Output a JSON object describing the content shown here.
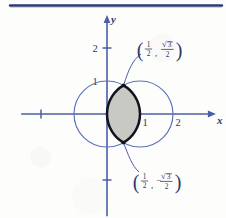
{
  "figure": {
    "title_rule": "top-horizontal-rule",
    "colors": {
      "axis": "#4a5fa5",
      "circle": "#5a72b8",
      "lens_outline": "#13131f",
      "lens_fill": "#c9c9c4",
      "label_text": "#2d3a6b",
      "rule": "#2b3a78",
      "background": "#fdfdfc"
    },
    "axes": {
      "x_axis_label": "x",
      "y_axis_label": "y",
      "origin_px": {
        "x": 107,
        "y": 114
      },
      "unit_px": 33,
      "x_ticks": [
        {
          "value": -2,
          "label": ""
        },
        {
          "value": 1,
          "label": "1"
        },
        {
          "value": 2,
          "label": "2"
        }
      ],
      "y_ticks": [
        {
          "value": 2,
          "label": "2"
        },
        {
          "value": 1,
          "label": "1"
        },
        {
          "value": -2,
          "label": ""
        }
      ],
      "x_range": [
        -2.6,
        3.3
      ],
      "y_range": [
        -3.1,
        3.0
      ]
    },
    "curves": [
      {
        "name": "circle-centered-origin",
        "cx": 0,
        "cy": 0,
        "r": 1
      },
      {
        "name": "circle-centered-one",
        "cx": 1,
        "cy": 0,
        "r": 1
      }
    ],
    "shaded_region": {
      "name": "lens-intersection",
      "description": "intersection of the two unit circles",
      "fill": "#c9c9c4"
    },
    "annotations": [
      {
        "name": "upper-intersection-point",
        "point": {
          "x": 0.5,
          "y": 0.8660254
        },
        "open_paren": "(",
        "x_num": "1",
        "x_den": "2",
        "comma": ",",
        "sign": "",
        "radical": "√",
        "y_num": "3",
        "y_den": "2",
        "close_paren": ")"
      },
      {
        "name": "lower-intersection-point",
        "point": {
          "x": 0.5,
          "y": -0.8660254
        },
        "open_paren": "(",
        "x_num": "1",
        "x_den": "2",
        "comma": ",",
        "sign": "−",
        "radical": "√",
        "y_num": "3",
        "y_den": "2",
        "close_paren": ")"
      }
    ]
  },
  "chart_data": {
    "type": "scatter",
    "title": "",
    "xlabel": "x",
    "ylabel": "y",
    "xlim": [
      -2.6,
      3.3
    ],
    "ylim": [
      -3.1,
      3.0
    ],
    "grid": false,
    "legend": "none",
    "xticks": [
      -2,
      1,
      2
    ],
    "xticklabels": [
      "",
      "1",
      "2"
    ],
    "yticks": [
      -2,
      1,
      2
    ],
    "yticklabels": [
      "",
      "1",
      "2"
    ],
    "series": [
      {
        "name": "circle x² + y² = 1",
        "type": "circle",
        "center": [
          0,
          0
        ],
        "radius": 1,
        "color": "#5a72b8"
      },
      {
        "name": "circle (x−1)² + y² = 1",
        "type": "circle",
        "center": [
          1,
          0
        ],
        "radius": 1,
        "color": "#5a72b8"
      },
      {
        "name": "shaded lens region",
        "type": "area",
        "color": "#c9c9c4",
        "outline": "#13131f"
      }
    ],
    "annotations": [
      {
        "text": "(1/2, √3/2)",
        "x": 0.5,
        "y": 0.866
      },
      {
        "text": "(1/2, −√3/2)",
        "x": 0.5,
        "y": -0.866
      }
    ]
  }
}
